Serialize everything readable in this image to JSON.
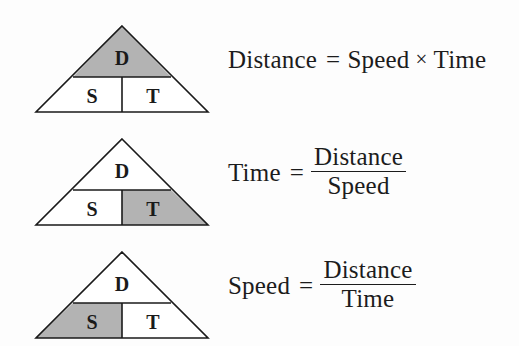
{
  "diagram": {
    "background_color": "#fdfdfd",
    "shade_color": "#b3b3b3",
    "outline_color": "#1a1a1a",
    "text_color": "#1c1c1c",
    "triangle_letters": {
      "top": "D",
      "bottom_left": "S",
      "bottom_right": "T"
    }
  },
  "rows": [
    {
      "shaded_cell": "top",
      "shaded_letter": "D",
      "letters": {
        "top": "D",
        "bottom_left": "S",
        "bottom_right": "T"
      },
      "equation": {
        "type": "product",
        "lhs": "Distance",
        "equals": "=",
        "factor_1": "Speed",
        "operator": "×",
        "factor_2": "Time"
      }
    },
    {
      "shaded_cell": "bottom_right",
      "shaded_letter": "T",
      "letters": {
        "top": "D",
        "bottom_left": "S",
        "bottom_right": "T"
      },
      "equation": {
        "type": "fraction",
        "lhs": "Time",
        "equals": "=",
        "numerator": "Distance",
        "denominator": "Speed"
      }
    },
    {
      "shaded_cell": "bottom_left",
      "shaded_letter": "S",
      "letters": {
        "top": "D",
        "bottom_left": "S",
        "bottom_right": "T"
      },
      "equation": {
        "type": "fraction",
        "lhs": "Speed",
        "equals": "=",
        "numerator": "Distance",
        "denominator": "Time"
      }
    }
  ]
}
